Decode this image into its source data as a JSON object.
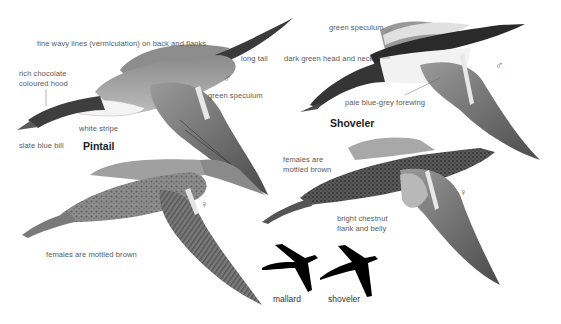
{
  "plate": {
    "title": "Pintail and Shoveler in flight",
    "colors": {
      "background": "#ffffff",
      "label_text": "#5a5a5a",
      "species_text": "#222222",
      "silhouette": "#000000"
    }
  },
  "pintail": {
    "name": "Pintail",
    "male": {
      "sex_symbol": "♂",
      "labels": {
        "vermiculation": "fine wavy lines (vermiculation) on back and flanks",
        "long_tail": "long tail",
        "hood_line1": "rich chocolate",
        "hood_line2": "coloured hood",
        "speculum": "green speculum",
        "white_stripe": "white stripe",
        "bill": "slate blue bill"
      }
    },
    "female": {
      "sex_symbol": "♀",
      "labels": {
        "mottled": "females are mottled brown"
      }
    }
  },
  "shoveler": {
    "name": "Shoveler",
    "male": {
      "sex_symbol": "♂",
      "labels": {
        "speculum": "green speculum",
        "head": "dark green head and neck",
        "forewing": "pale blue-grey forewing"
      }
    },
    "female": {
      "sex_symbol": "♀",
      "labels": {
        "mottled_line1": "females are",
        "mottled_line2": "mottled brown",
        "flank_line1": "bright chestnut",
        "flank_line2": "flank and belly"
      }
    }
  },
  "silhouettes": [
    {
      "label": "mallard"
    },
    {
      "label": "shoveler"
    }
  ]
}
